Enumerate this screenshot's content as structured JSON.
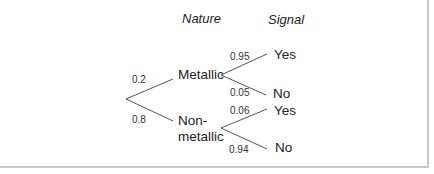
{
  "headers": {
    "nature": "Nature",
    "signal": "Signal"
  },
  "root_branches": [
    {
      "prob": "0.2",
      "node": "Metallic"
    },
    {
      "prob": "0.8",
      "node_line1": "Non-",
      "node_line2": "metallic"
    }
  ],
  "metallic_branches": [
    {
      "prob": "0.95",
      "outcome": "Yes"
    },
    {
      "prob": "0.05",
      "outcome": "No"
    }
  ],
  "nonmetallic_branches": [
    {
      "prob": "0.06",
      "outcome": "Yes"
    },
    {
      "prob": "0.94",
      "outcome": "No"
    }
  ],
  "colors": {
    "line": "#555555",
    "border": "#c8c8c8"
  }
}
